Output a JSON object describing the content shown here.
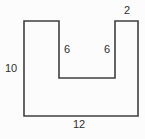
{
  "diagram": {
    "type": "geometry-figure",
    "shape": {
      "points": "24,21 59,21 59,78 115,78 115,21 138,21 138,116 24,116",
      "stroke_color": "#3f3f3f"
    },
    "labels": {
      "top_right_width": "2",
      "left_height": "10",
      "inner_left_depth": "6",
      "inner_right_depth": "6",
      "bottom_width": "12"
    }
  }
}
